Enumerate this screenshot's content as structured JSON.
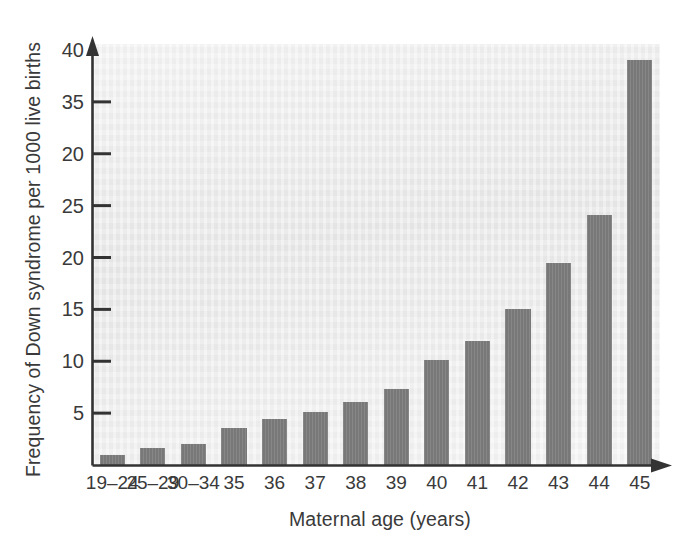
{
  "chart_data": {
    "type": "bar",
    "title": "",
    "xlabel": "Maternal age (years)",
    "ylabel": "Frequency of Down syndrome per 1000 live births",
    "categories": [
      "19–24",
      "25–29",
      "30–34",
      "35",
      "36",
      "37",
      "38",
      "39",
      "40",
      "41",
      "42",
      "43",
      "44",
      "45"
    ],
    "values": [
      1.0,
      1.6,
      2.0,
      3.6,
      4.4,
      5.1,
      6.1,
      7.3,
      10.1,
      12.0,
      15.0,
      19.5,
      24.1,
      39.0
    ],
    "ytick_labels": [
      "5",
      "10",
      "15",
      "20",
      "25",
      "20",
      "35",
      "40"
    ],
    "ytick_values": [
      5,
      10,
      15,
      20,
      25,
      30,
      35,
      40
    ],
    "ylim": [
      0,
      40
    ],
    "grid": false,
    "legend": null,
    "bar_color": "#7e7e7e",
    "plot_background": "#e8e8e8",
    "axis_color": "#333333",
    "text_color": "#3a3a3a"
  },
  "axes": {
    "y_title": "Frequency of Down syndrome per 1000 live births",
    "x_title": "Maternal age (years)"
  }
}
